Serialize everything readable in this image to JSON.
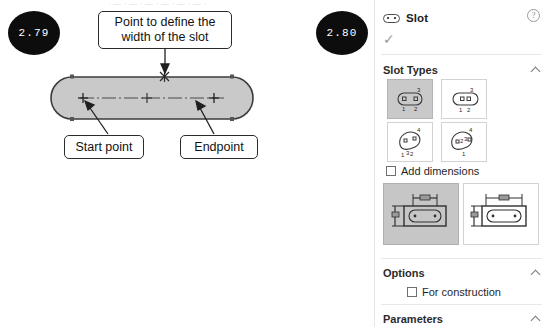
{
  "top_ghost_text": "· — · — · — · — · — · — ·",
  "figure": {
    "step_number": "2.79",
    "callouts": {
      "width_point": "Point to define the\nwidth of the slot",
      "width_point_line1": "Point to define the",
      "width_point_line2": "width of the slot",
      "start_point": "Start point",
      "endpoint": "Endpoint"
    },
    "shape_fill": "#c9c9c9",
    "shape_stroke": "#3c3c3c"
  },
  "panel": {
    "step_number": "2.80",
    "title": "Slot",
    "title_icon": "slot-icon",
    "help_icon": "?",
    "confirm_icon": "✓",
    "sections": [
      {
        "label": "Slot Types",
        "expanded": true
      },
      {
        "label": "Options",
        "expanded": true
      },
      {
        "label": "Parameters",
        "expanded": true
      }
    ],
    "slot_types_label": "Slot Types",
    "options_label": "Options",
    "parameters_label": "Parameters",
    "slot_types": [
      {
        "name": "center-to-center-slot",
        "selected": true,
        "labels": [
          "1",
          "2",
          "3"
        ]
      },
      {
        "name": "overall-slot",
        "selected": false,
        "labels": [
          "1",
          "2",
          "3"
        ]
      },
      {
        "name": "3-point-arc-slot",
        "selected": false,
        "labels": [
          "1",
          "2",
          "3",
          "4"
        ]
      },
      {
        "name": "centerpoint-arc-slot",
        "selected": false,
        "labels": [
          "1",
          "2",
          "3",
          "4"
        ]
      }
    ],
    "add_dimensions": {
      "label": "Add dimensions",
      "checked": false
    },
    "dimension_styles": [
      {
        "name": "center-to-center-dimension",
        "selected": true
      },
      {
        "name": "overall-dimension",
        "selected": false
      }
    ],
    "for_construction": {
      "label": "For construction",
      "checked": false
    }
  },
  "colors": {
    "badge_bg": "#0d0d0d",
    "badge_text": "#ffffff",
    "panel_bg": "#ffffff",
    "divider": "#e8e8e8",
    "selected_tile": "#c9c9c9",
    "text": "#1c1c1c",
    "muted": "#8d8d8d"
  }
}
